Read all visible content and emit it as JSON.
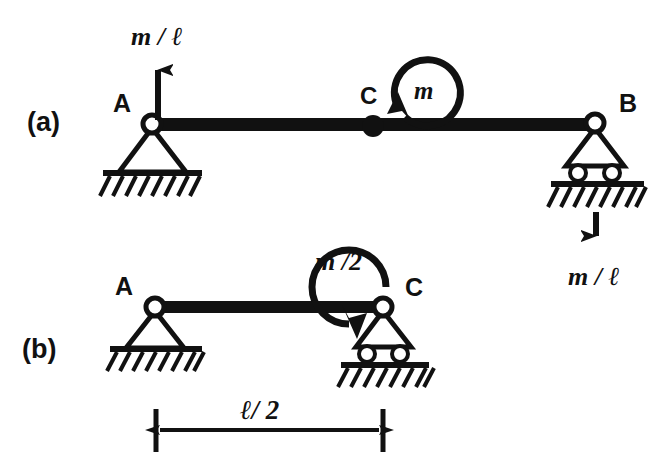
{
  "figure": {
    "background_color": "#ffffff",
    "ink_color": "#111111",
    "width": 667,
    "height": 469
  },
  "panels": [
    {
      "key": "a",
      "label": "(a)",
      "description": "Full span beam A to B with couple m at midpoint C and reaction forces m/l",
      "nodes": [
        {
          "name": "A",
          "label": "A",
          "support": "pin",
          "x": 152,
          "y": 125
        },
        {
          "name": "C",
          "label": "C",
          "support": "none",
          "x": 373,
          "y": 127
        },
        {
          "name": "B",
          "label": "B",
          "support": "roller",
          "x": 595,
          "y": 124
        }
      ],
      "loads": [
        {
          "name": "reaction-at-a",
          "type": "force",
          "label": "m / ℓ",
          "direction": "up",
          "at_node": "A",
          "x": 158,
          "tail_y": 122,
          "tip_y": 57,
          "label_x": 160,
          "label_y": 40
        },
        {
          "name": "couple-at-c",
          "type": "moment",
          "label": "m",
          "sense": "counterclockwise",
          "at_node": "C",
          "label_x": 412,
          "label_y": 100
        },
        {
          "name": "reaction-at-b",
          "type": "force",
          "label": "m / ℓ",
          "direction": "down",
          "at_node": "B",
          "x": 596,
          "tail_y": 197,
          "tip_y": 248,
          "label_x": 598,
          "label_y": 281
        }
      ]
    },
    {
      "key": "b",
      "label": "(b)",
      "description": "Half span beam A to C with couple m/2 applied at C",
      "nodes": [
        {
          "name": "A",
          "label": "A",
          "support": "pin",
          "x": 155,
          "y": 307
        },
        {
          "name": "C",
          "label": "C",
          "support": "roller",
          "x": 383,
          "y": 307
        }
      ],
      "loads": [
        {
          "name": "couple-at-c",
          "type": "moment",
          "label": "m /2",
          "sense": "clockwise",
          "at_node": "C",
          "label_x": 344,
          "label_y": 266
        }
      ]
    }
  ],
  "dimension": {
    "name": "half-span-dimension",
    "label": "ℓ/ 2",
    "from_x": 156,
    "to_x": 383,
    "line_y": 430,
    "tick_top": 409,
    "tick_bottom": 452,
    "label_x": 268,
    "label_y": 415
  },
  "text_labels": {
    "panel_a": "(a)",
    "panel_b": "(b)",
    "node_a_panel_a": "A",
    "node_b_panel_a": "B",
    "node_c_panel_a": "C",
    "node_a_panel_b": "A",
    "node_c_panel_b": "C",
    "force_left": "m / ℓ",
    "force_right": "m / ℓ",
    "moment_full": "m",
    "moment_half": "m /2",
    "dimension": "ℓ/ 2"
  }
}
